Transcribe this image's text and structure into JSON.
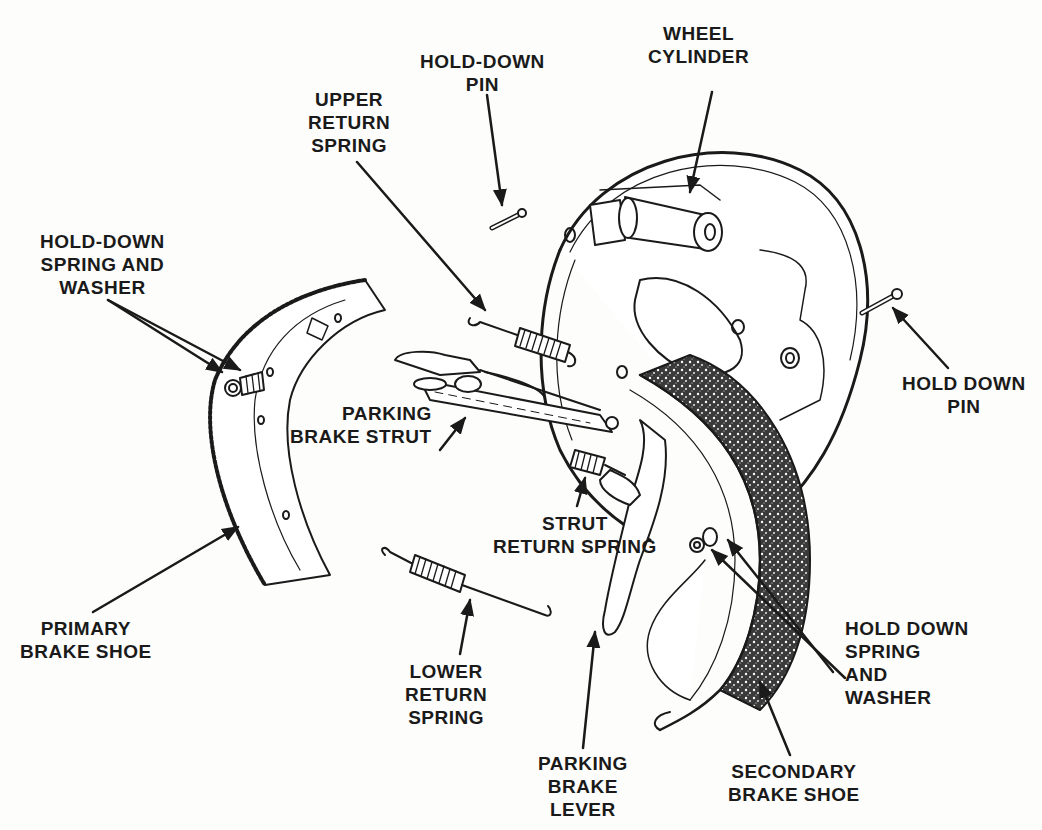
{
  "diagram": {
    "colors": {
      "ink": "#1a1a1a",
      "paper": "#fdfdfc",
      "lining": "#2a2a2a"
    },
    "labels": [
      {
        "id": "wheel-cylinder",
        "lines": [
          "WHEEL",
          "CYLINDER"
        ]
      },
      {
        "id": "hold-down-pin-top",
        "lines": [
          "HOLD-DOWN",
          "PIN"
        ]
      },
      {
        "id": "upper-return-spring",
        "lines": [
          "UPPER",
          "RETURN",
          "SPRING"
        ]
      },
      {
        "id": "hold-down-spring-washer-left",
        "lines": [
          "HOLD-DOWN",
          "SPRING AND",
          "WASHER"
        ]
      },
      {
        "id": "hold-down-pin-right",
        "lines": [
          "HOLD DOWN",
          "PIN"
        ]
      },
      {
        "id": "parking-brake-strut",
        "lines": [
          "PARKING",
          "BRAKE STRUT"
        ]
      },
      {
        "id": "strut-return-spring",
        "lines": [
          "STRUT",
          "RETURN SPRING"
        ]
      },
      {
        "id": "primary-brake-shoe",
        "lines": [
          "PRIMARY",
          "BRAKE SHOE"
        ]
      },
      {
        "id": "lower-return-spring",
        "lines": [
          "LOWER",
          "RETURN",
          "SPRING"
        ]
      },
      {
        "id": "hold-down-spring-washer-right",
        "lines": [
          "HOLD DOWN",
          "SPRING",
          "AND",
          "WASHER"
        ]
      },
      {
        "id": "parking-brake-lever",
        "lines": [
          "PARKING",
          "BRAKE",
          "LEVER"
        ]
      },
      {
        "id": "secondary-brake-shoe",
        "lines": [
          "SECONDARY",
          "BRAKE SHOE"
        ]
      }
    ]
  }
}
